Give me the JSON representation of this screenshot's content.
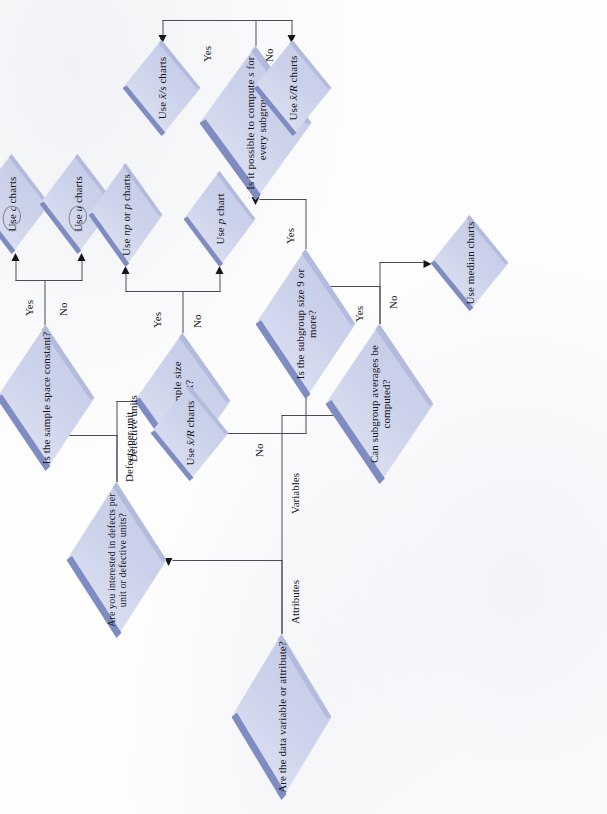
{
  "document": {
    "title": "Control chart selection flowchart",
    "orientation": "rotated-90-ccw",
    "background_color": "#fdfdfd",
    "node_fill_color": "#ccd2ea",
    "node_bevel_color": "#7f8cc2",
    "line_color": "#4c4c58",
    "text_color": "#15151c"
  },
  "nodes": {
    "root": {
      "label": "Are the data variable or attribute?",
      "kind": "decision"
    },
    "interest": {
      "label": "Are you interested in defects per unit or defective units?",
      "kind": "decision"
    },
    "sample_space_constant": {
      "label": "Is the sample space constant?",
      "kind": "decision"
    },
    "sample_size_constant": {
      "label": "Is the sample size constant?",
      "kind": "decision"
    },
    "subgroup_avg": {
      "label": "Can subgroup averages be computed?",
      "kind": "decision"
    },
    "subgroup_size": {
      "label": "Is the subgroup size 9 or more?",
      "kind": "decision"
    },
    "compute_s": {
      "label": "Is it possible to compute s for every subgroup?",
      "kind": "decision"
    },
    "c_charts": {
      "label": "Use c charts",
      "kind": "terminal"
    },
    "u_charts": {
      "label": "Use u charts",
      "kind": "terminal"
    },
    "np_p_charts": {
      "label": "Use np or p charts",
      "kind": "terminal"
    },
    "p_chart": {
      "label": "Use p chart",
      "kind": "terminal"
    },
    "median_charts": {
      "label": "Use median charts",
      "kind": "terminal"
    },
    "xbar_r_charts_left": {
      "label": "Use x̄/R charts",
      "kind": "terminal"
    },
    "xbar_s_charts": {
      "label": "Use x̄/s charts",
      "kind": "terminal"
    },
    "xbar_r_charts_right": {
      "label": "Use x̄/R charts",
      "kind": "terminal"
    }
  },
  "edges": {
    "attributes": "Attributes",
    "variables": "Variables",
    "defects_per_unit": "Defects per unit",
    "defective_units": "Defective units",
    "space_yes": "Yes",
    "space_no": "No",
    "size_yes": "Yes",
    "size_no": "No",
    "avg_yes": "Yes",
    "avg_no": "No",
    "subgroup_yes": "Yes",
    "subgroup_no": "No",
    "computes_yes": "Yes",
    "computes_no": "No"
  },
  "chart_data": {
    "type": "table",
    "columns": [
      "question",
      "answer",
      "leads_to"
    ],
    "rows": [
      [
        "Are the data variable or attribute?",
        "Attributes",
        "Are you interested in defects per unit or defective units?"
      ],
      [
        "Are the data variable or attribute?",
        "Variables",
        "Can subgroup averages be computed?"
      ],
      [
        "Are you interested in defects per unit or defective units?",
        "Defects per unit",
        "Is the sample space constant?"
      ],
      [
        "Are you interested in defects per unit or defective units?",
        "Defective units",
        "Is the sample size constant?"
      ],
      [
        "Is the sample space constant?",
        "Yes",
        "Use c charts"
      ],
      [
        "Is the sample space constant?",
        "No",
        "Use u charts"
      ],
      [
        "Is the sample size constant?",
        "Yes",
        "Use np or p charts"
      ],
      [
        "Is the sample size constant?",
        "No",
        "Use p chart"
      ],
      [
        "Can subgroup averages be computed?",
        "Yes",
        "Is the subgroup size 9 or more?"
      ],
      [
        "Can subgroup averages be computed?",
        "No",
        "Use median charts"
      ],
      [
        "Is the subgroup size 9 or more?",
        "Yes",
        "Is it possible to compute s for every subgroup?"
      ],
      [
        "Is the subgroup size 9 or more?",
        "No",
        "Use x̄/R charts"
      ],
      [
        "Is it possible to compute s for every subgroup?",
        "Yes",
        "Use x̄/s charts"
      ],
      [
        "Is it possible to compute s for every subgroup?",
        "No",
        "Use x̄/R charts"
      ]
    ]
  }
}
